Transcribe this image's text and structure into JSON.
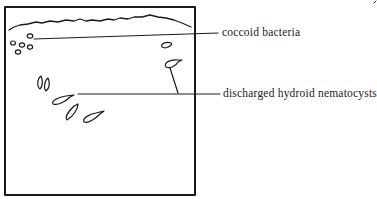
{
  "diagram": {
    "type": "microscope-field sketch",
    "labels": [
      {
        "id": "coccoid",
        "text": "coccoid bacteria"
      },
      {
        "id": "nematocysts",
        "text": "discharged hydroid nematocysts"
      }
    ],
    "colors": {
      "ink": "#1a1a1a",
      "background": "#ffffff"
    }
  }
}
